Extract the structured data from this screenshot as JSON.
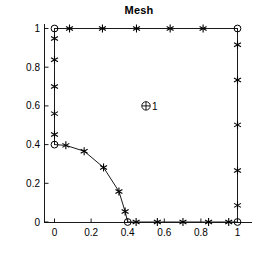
{
  "title": "Mesh",
  "sd_label": "1",
  "chart_data": {
    "type": "scatter",
    "title": "Mesh",
    "xlabel": "",
    "ylabel": "",
    "xlim": [
      -0.1,
      1.12
    ],
    "ylim": [
      -0.08,
      1.08
    ],
    "xticks": [
      0,
      0.2,
      0.4,
      0.6,
      0.8,
      1
    ],
    "xticklabels": [
      "0",
      "0.2",
      "0.4",
      "0.6",
      "0.8",
      "1"
    ],
    "yticks": [
      0,
      0.2,
      0.4,
      0.6,
      0.8,
      1
    ],
    "yticklabels": [
      "0",
      "0.2",
      "0.4",
      "0.6",
      "0.8",
      "1"
    ],
    "grid": false,
    "legend": null,
    "annotations": [
      {
        "text": "1",
        "x": 0.5,
        "y": 0.6,
        "marker": "circled-plus"
      }
    ],
    "series": [
      {
        "name": "boundary-edges",
        "type": "line",
        "color": "#1a1a1a",
        "segments": [
          {
            "name": "top-edge",
            "points": [
              [
                0,
                1
              ],
              [
                1,
                1
              ]
            ]
          },
          {
            "name": "right-edge",
            "points": [
              [
                1,
                1
              ],
              [
                1,
                0
              ]
            ]
          },
          {
            "name": "bottom-edge",
            "points": [
              [
                0.4,
                0
              ],
              [
                1,
                0
              ]
            ]
          },
          {
            "name": "left-edge",
            "points": [
              [
                0,
                1
              ],
              [
                0,
                0.4
              ]
            ]
          },
          {
            "name": "arc-edge",
            "points": [
              [
                0,
                0.4
              ],
              [
                0.062,
                0.396
              ],
              [
                0.162,
                0.366
              ],
              [
                0.268,
                0.282
              ],
              [
                0.352,
                0.158
              ],
              [
                0.386,
                0.054
              ],
              [
                0.4,
                0
              ]
            ]
          }
        ]
      },
      {
        "name": "boundary-nodes-star",
        "type": "scatter",
        "marker": "asterisk",
        "color": "#000000",
        "points": [
          [
            0.082,
            1
          ],
          [
            0.262,
            1
          ],
          [
            0.448,
            1
          ],
          [
            0.632,
            1
          ],
          [
            0.812,
            1
          ],
          [
            1,
            0.916
          ],
          [
            1,
            0.734
          ],
          [
            1,
            0.502
          ],
          [
            1,
            0.266
          ],
          [
            1,
            0.086
          ],
          [
            0.446,
            0
          ],
          [
            0.562,
            0
          ],
          [
            0.702,
            0
          ],
          [
            0.842,
            0
          ],
          [
            0.952,
            0
          ],
          [
            0,
            0.948
          ],
          [
            0,
            0.838
          ],
          [
            0,
            0.7
          ],
          [
            0,
            0.56
          ],
          [
            0,
            0.452
          ],
          [
            0.062,
            0.396
          ],
          [
            0.162,
            0.366
          ],
          [
            0.268,
            0.282
          ],
          [
            0.352,
            0.158
          ],
          [
            0.386,
            0.054
          ]
        ]
      },
      {
        "name": "boundary-nodes-circle",
        "type": "scatter",
        "marker": "circle",
        "color": "#000000",
        "points": [
          [
            0,
            1
          ],
          [
            1,
            1
          ],
          [
            1,
            0
          ],
          [
            0.4,
            0
          ],
          [
            0,
            0.4
          ]
        ]
      }
    ]
  }
}
